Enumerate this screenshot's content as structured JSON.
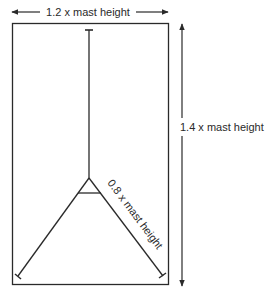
{
  "diagram": {
    "width_label": "1.2 x mast height",
    "height_label": "1.4 x mast height",
    "leg_label": "0.8 x mast height",
    "colors": {
      "line": "#2a2a2a",
      "background": "#ffffff"
    }
  }
}
